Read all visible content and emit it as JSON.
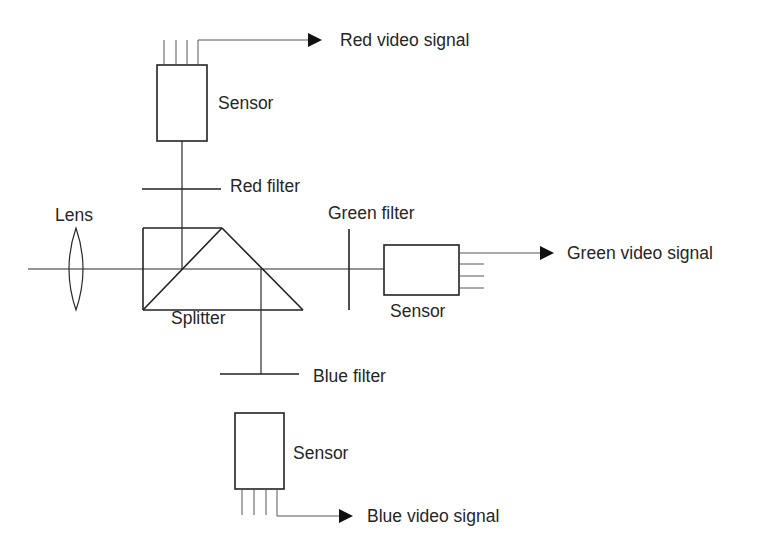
{
  "diagram": {
    "type": "three-sensor color camera optical path",
    "labels": {
      "lens": "Lens",
      "splitter": "Splitter",
      "red_filter": "Red filter",
      "green_filter": "Green filter",
      "blue_filter": "Blue filter",
      "sensor_red": "Sensor",
      "sensor_green": "Sensor",
      "sensor_blue": "Sensor",
      "red_signal": "Red video signal",
      "green_signal": "Green video signal",
      "blue_signal": "Blue video signal"
    },
    "colors": {
      "line": "#2a2a2a",
      "text": "#262626",
      "background": "#ffffff"
    }
  }
}
